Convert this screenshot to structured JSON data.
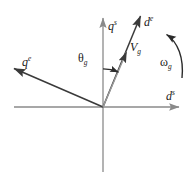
{
  "figure": {
    "type": "vector-diagram",
    "title": "",
    "background_color": "#ffffff",
    "line_color": "#3a3a3a",
    "axis_color": "#8a8a8a",
    "text_color": "#1a1a1a",
    "width": 194,
    "height": 177
  },
  "origin": {
    "x": 103,
    "y": 107
  },
  "axes": [
    {
      "name": "vertical-axis",
      "label_base": "q",
      "label_sup": "s",
      "from": {
        "x": 103,
        "y": 172
      },
      "to": {
        "x": 103,
        "y": 17
      },
      "arrow": true
    },
    {
      "name": "horizontal-axis",
      "label_base": "d",
      "label_sup": "s",
      "from": {
        "x": 14,
        "y": 107
      },
      "to": {
        "x": 181,
        "y": 107
      },
      "arrow": true
    }
  ],
  "vectors": [
    {
      "name": "q-rotor-axis",
      "label_base": "q",
      "label_sup": "e",
      "from": {
        "x": 103,
        "y": 107
      },
      "to": {
        "x": 11,
        "y": 67
      },
      "arrow": true
    },
    {
      "name": "d-rotor-axis",
      "label_base": "d",
      "label_sup": "e",
      "from": {
        "x": 103,
        "y": 107
      },
      "to": {
        "x": 142,
        "y": 13
      },
      "arrow": true
    },
    {
      "name": "voltage-vector",
      "label_base": "V",
      "label_sub": "g",
      "from": {
        "x": 103,
        "y": 107
      },
      "to": {
        "x": 127,
        "y": 50
      },
      "arrow": true
    }
  ],
  "angle": {
    "name": "theta-g",
    "label_base": "θ",
    "label_sub": "g",
    "between": [
      "vertical-axis",
      "voltage-vector"
    ],
    "arc_radius": 38
  },
  "rotation": {
    "name": "omega-g",
    "label_base": "ω",
    "label_sub": "g",
    "direction": "counter-clockwise",
    "arc": {
      "start": {
        "x": 181,
        "y": 77
      },
      "end": {
        "x": 164,
        "y": 35
      }
    }
  }
}
